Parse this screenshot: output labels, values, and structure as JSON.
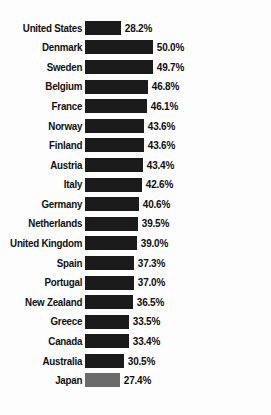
{
  "chart_data": {
    "type": "bar",
    "title": "",
    "subtitle": "",
    "xlabel": "",
    "ylabel": "",
    "orientation": "horizontal",
    "grid": false,
    "legend": "none",
    "axis_visible": false,
    "value_suffix": "%",
    "xlim": [
      0,
      50
    ],
    "value_format": "one-decimal-percent",
    "highlight_country": "United States",
    "highlight_note": "United States listed first, out of descending order",
    "bar_color_default": "#1b1b1b",
    "bar_color_light": "#6b6b6b",
    "text_color": "#101010",
    "background": "#ffffff",
    "categories": [
      "United States",
      "Denmark",
      "Sweden",
      "Belgium",
      "France",
      "Norway",
      "Finland",
      "Austria",
      "Italy",
      "Germany",
      "Netherlands",
      "United Kingdom",
      "Spain",
      "Portugal",
      "New Zealand",
      "Greece",
      "Canada",
      "Australia",
      "Japan"
    ],
    "values": [
      28.2,
      50.0,
      49.7,
      46.8,
      46.1,
      43.6,
      43.6,
      43.4,
      42.6,
      40.6,
      39.5,
      39.0,
      37.3,
      37.0,
      36.5,
      33.5,
      33.4,
      30.5,
      27.4
    ],
    "value_labels": [
      "28.2%",
      "50.0%",
      "49.7%",
      "46.8%",
      "46.1%",
      "43.6%",
      "43.6%",
      "43.4%",
      "42.6%",
      "40.6%",
      "39.5%",
      "39.0%",
      "37.3%",
      "37.0%",
      "36.5%",
      "33.5%",
      "33.4%",
      "30.5%",
      "27.4%"
    ]
  },
  "rows": [
    {
      "label": "United States",
      "value": 28.2,
      "value_label": "28.2%",
      "shade": "dark"
    },
    {
      "label": "Denmark",
      "value": 50.0,
      "value_label": "50.0%",
      "shade": "dark"
    },
    {
      "label": "Sweden",
      "value": 49.7,
      "value_label": "49.7%",
      "shade": "dark"
    },
    {
      "label": "Belgium",
      "value": 46.8,
      "value_label": "46.8%",
      "shade": "dark"
    },
    {
      "label": "France",
      "value": 46.1,
      "value_label": "46.1%",
      "shade": "dark"
    },
    {
      "label": "Norway",
      "value": 43.6,
      "value_label": "43.6%",
      "shade": "dark"
    },
    {
      "label": "Finland",
      "value": 43.6,
      "value_label": "43.6%",
      "shade": "dark"
    },
    {
      "label": "Austria",
      "value": 43.4,
      "value_label": "43.4%",
      "shade": "dark"
    },
    {
      "label": "Italy",
      "value": 42.6,
      "value_label": "42.6%",
      "shade": "dark"
    },
    {
      "label": "Germany",
      "value": 40.6,
      "value_label": "40.6%",
      "shade": "dark"
    },
    {
      "label": "Netherlands",
      "value": 39.5,
      "value_label": "39.5%",
      "shade": "dark"
    },
    {
      "label": "United Kingdom",
      "value": 39.0,
      "value_label": "39.0%",
      "shade": "dark"
    },
    {
      "label": "Spain",
      "value": 37.3,
      "value_label": "37.3%",
      "shade": "dark"
    },
    {
      "label": "Portugal",
      "value": 37.0,
      "value_label": "37.0%",
      "shade": "dark"
    },
    {
      "label": "New Zealand",
      "value": 36.5,
      "value_label": "36.5%",
      "shade": "dark"
    },
    {
      "label": "Greece",
      "value": 33.5,
      "value_label": "33.5%",
      "shade": "dark"
    },
    {
      "label": "Canada",
      "value": 33.4,
      "value_label": "33.4%",
      "shade": "dark"
    },
    {
      "label": "Australia",
      "value": 30.5,
      "value_label": "30.5%",
      "shade": "dark"
    },
    {
      "label": "Japan",
      "value": 27.4,
      "value_label": "27.4%",
      "shade": "light"
    }
  ],
  "scale": {
    "px_per_unit": 1.47,
    "base_px": 36,
    "base_value": 28.2
  }
}
